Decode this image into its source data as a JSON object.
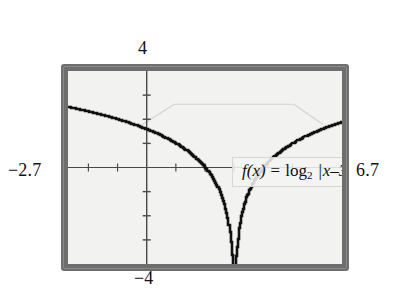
{
  "figure": {
    "kind": "graphing-calculator-screen",
    "window": {
      "xmin_label": "−2.7",
      "xmax_label": "6.7",
      "ymax_label": "4",
      "ymin_label": "−4"
    },
    "equation": {
      "lhs": "f(x)",
      "equals": "=",
      "log": "log",
      "base": "2",
      "bar_open": "|",
      "argument": "x–3",
      "bar_close": "|",
      "plain": "f(x) = log₂ |x–3|"
    },
    "colors": {
      "bezel": "#6e6e6e",
      "screen": "#f2f2f0",
      "curve": "#111111",
      "axis": "#4a4a4a",
      "label": "#111111"
    }
  },
  "chart_data": {
    "type": "line",
    "title": "",
    "subtitle": "",
    "xlabel": "",
    "ylabel": "",
    "annotations": [
      "f(x) = log₂ |x–3|"
    ],
    "legend": [],
    "legend_position": "none",
    "grid": false,
    "xlim": [
      -2.7,
      6.7
    ],
    "ylim": [
      -4,
      4
    ],
    "xticks": [
      -2,
      -1,
      0,
      1,
      2,
      3,
      4,
      5,
      6
    ],
    "yticks": [
      -3,
      -2,
      -1,
      0,
      1,
      2,
      3
    ],
    "tick_labels_shown": false,
    "asymptote": {
      "type": "vertical",
      "x": 3
    },
    "series": [
      {
        "name": "f(x) = log2 |x-3|",
        "x": [
          -2.7,
          -2.4,
          -2.1,
          -1.8,
          -1.5,
          -1.2,
          -0.9,
          -0.6,
          -0.3,
          0.0,
          0.3,
          0.6,
          0.9,
          1.2,
          1.5,
          1.8,
          2.1,
          2.4,
          2.6,
          2.8,
          2.9,
          2.95,
          2.98,
          2.995,
          3.005,
          3.02,
          3.05,
          3.1,
          3.2,
          3.4,
          3.6,
          3.9,
          4.2,
          4.5,
          4.8,
          5.1,
          5.4,
          5.7,
          6.0,
          6.3,
          6.7
        ],
        "y": [
          2.51,
          2.43,
          2.35,
          2.26,
          2.17,
          2.07,
          1.96,
          1.85,
          1.72,
          1.58,
          1.43,
          1.26,
          1.07,
          0.85,
          0.58,
          0.26,
          -0.15,
          -0.74,
          -1.32,
          -2.32,
          -3.32,
          -4.32,
          -5.64,
          -7.64,
          -7.64,
          -5.64,
          -4.32,
          -3.32,
          -2.32,
          -1.32,
          -0.74,
          -0.15,
          0.26,
          0.58,
          0.85,
          1.07,
          1.26,
          1.43,
          1.58,
          1.72,
          1.89
        ]
      }
    ]
  }
}
